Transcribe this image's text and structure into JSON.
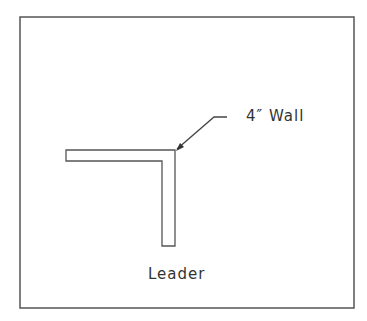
{
  "diagram": {
    "callout_label": "4″ Wall",
    "caption": "Leader",
    "colors": {
      "line": "#555555",
      "background": "#ffffff"
    }
  }
}
